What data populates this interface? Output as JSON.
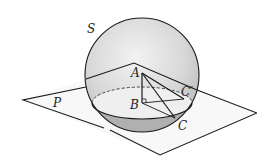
{
  "figure": {
    "type": "geometry-diagram",
    "labels": {
      "sphere": "S",
      "plane": "P",
      "point_a": "A",
      "point_b": "B",
      "point_c": "C",
      "point_c_prime": "C′"
    },
    "colors": {
      "line": "#1a1a1a",
      "sphere_fill_light": "#eaeaea",
      "sphere_fill_dark": "#bdbdbd",
      "plane_fill": "#f7f7f7",
      "cap_fill": "#b3b3b3"
    }
  }
}
